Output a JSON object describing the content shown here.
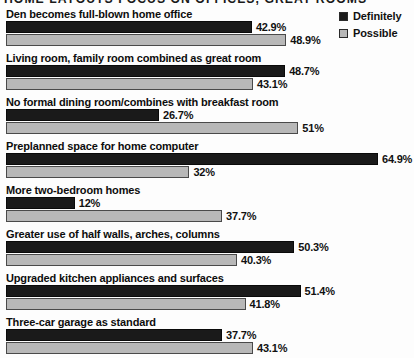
{
  "title": "HOME LAYOUTS FOCUS ON OFFICES, GREAT ROOMS",
  "legend": {
    "position": "top-right",
    "items": [
      {
        "label": "Definitely",
        "color": "#1a1a1a",
        "icon": "legend-swatch-icon"
      },
      {
        "label": "Possible",
        "color": "#b8b8b8",
        "icon": "legend-swatch-icon"
      }
    ]
  },
  "chart_data": {
    "type": "bar",
    "orientation": "horizontal",
    "title": "HOME LAYOUTS FOCUS ON OFFICES, GREAT ROOMS",
    "xlabel": "",
    "ylabel": "",
    "xlim": [
      0,
      64.9
    ],
    "grid": false,
    "legend_position": "top-right",
    "value_suffix": "%",
    "categories": [
      "Den becomes full-blown home office",
      "Living room, family room combined as great room",
      "No formal dining room/combines with breakfast room",
      "Preplanned space for home computer",
      "More two-bedroom homes",
      "Greater use of half walls, arches, columns",
      "Upgraded kitchen appliances and surfaces",
      "Three-car garage as standard"
    ],
    "series": [
      {
        "name": "Definitely",
        "color": "#1a1a1a",
        "values": [
          42.9,
          48.7,
          26.7,
          64.9,
          12,
          50.3,
          51.4,
          37.7
        ],
        "labels": [
          "42.9%",
          "48.7%",
          "26.7%",
          "64.9%",
          "12%",
          "50.3%",
          "51.4%",
          "37.7%"
        ]
      },
      {
        "name": "Possible",
        "color": "#b8b8b8",
        "values": [
          48.9,
          43.1,
          51,
          32,
          37.7,
          40.3,
          41.8,
          43.1
        ],
        "labels": [
          "48.9%",
          "43.1%",
          "51%",
          "32%",
          "37.7%",
          "40.3%",
          "41.8%",
          "43.1%"
        ]
      }
    ]
  }
}
